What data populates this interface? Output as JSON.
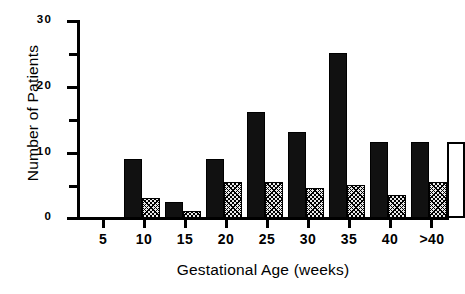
{
  "chart_data": {
    "type": "bar",
    "title": "",
    "xlabel": "Gestational Age (weeks)",
    "ylabel": "Number of Patients",
    "categories": [
      "5",
      "10",
      "15",
      "20",
      "25",
      "30",
      "35",
      "40",
      ">40"
    ],
    "ylim": [
      0,
      30
    ],
    "yticks": [
      0,
      10,
      20,
      30
    ],
    "ytick_labels": [
      "0",
      "10",
      "20",
      "30"
    ],
    "yminor_ticks": [
      5,
      15,
      25
    ],
    "grid": false,
    "legend": "none",
    "series": [
      {
        "name": "solid-black",
        "fill": "solid black",
        "values": [
          0,
          9,
          2.5,
          9,
          16,
          13,
          25,
          11.5,
          11.5
        ]
      },
      {
        "name": "hatched",
        "fill": "diagonal crosshatch",
        "values": [
          0,
          3,
          1,
          5.5,
          5.5,
          4.5,
          5,
          3.5,
          5.5
        ]
      },
      {
        "name": "open-white",
        "fill": "open white",
        "values": [
          0,
          0,
          0,
          0,
          0,
          0,
          0,
          0,
          11.5
        ]
      }
    ]
  },
  "axes": {
    "y_title": "Number of Patients",
    "x_title": "Gestational Age (weeks)",
    "y_labels": [
      "30",
      "20",
      "10",
      "0"
    ],
    "x_labels": [
      "5",
      "10",
      "15",
      "20",
      "25",
      "30",
      "35",
      "40",
      ">40"
    ]
  }
}
